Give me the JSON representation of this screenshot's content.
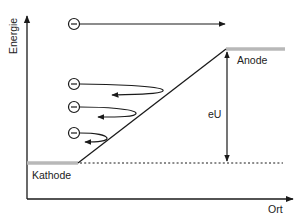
{
  "diagram": {
    "axes": {
      "y_label": "Energie",
      "x_label": "Ort"
    },
    "labels": {
      "cathode": "Kathode",
      "anode": "Anode",
      "potential": "eU"
    },
    "electron_symbol": "−",
    "electrons": [
      {
        "id": "escaping",
        "description": "electron passes to anode"
      },
      {
        "id": "reflected-1",
        "description": "electron reflected"
      },
      {
        "id": "reflected-2",
        "description": "electron reflected"
      },
      {
        "id": "reflected-3",
        "description": "electron reflected"
      }
    ],
    "colors": {
      "line": "#1a1a1a",
      "electrode": "#b8b8b8",
      "text": "#222222"
    }
  }
}
